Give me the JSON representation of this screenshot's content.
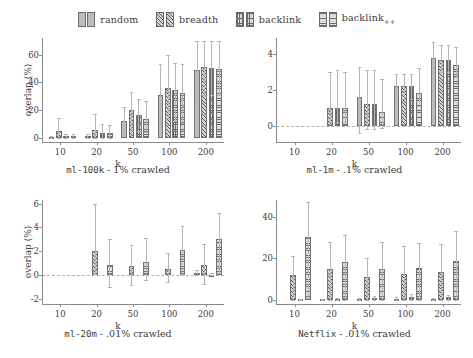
{
  "legend": {
    "entries": [
      {
        "label": "random",
        "pattern": "random",
        "color": "#bdbdbd"
      },
      {
        "label": "breadth",
        "pattern": "breadth",
        "color": "#5e5e5e"
      },
      {
        "label": "backlink",
        "pattern": "backlink",
        "color": "#dadada"
      },
      {
        "label": "backlink++",
        "pattern": "backlinkpp",
        "color": "#dcdcdc"
      }
    ]
  },
  "series_names": [
    "random",
    "breadth",
    "backlink",
    "backlink++"
  ],
  "chart_data": [
    {
      "id": "ml-100k",
      "type": "bar",
      "title": "ml-100k - 1% crawled",
      "title_mono": "ml-100k",
      "title_rest": " - 1% crawled",
      "xlabel": "k",
      "ylabel": "overlap (%)",
      "categories": [
        "10",
        "20",
        "50",
        "100",
        "200"
      ],
      "yticks": [
        0,
        20,
        40,
        60
      ],
      "ylim": [
        -3,
        72
      ],
      "grid": false,
      "zero_line": false,
      "series": [
        {
          "name": "random",
          "values": [
            0.5,
            1.0,
            12.5,
            31.0,
            49.0
          ],
          "err_low": [
            0.0,
            0.0,
            5.0,
            8.0,
            30.0
          ],
          "err_high": [
            1.5,
            2.5,
            22.0,
            53.0,
            70.0
          ]
        },
        {
          "name": "breadth",
          "values": [
            5.0,
            5.5,
            20.0,
            36.0,
            51.0
          ],
          "err_low": [
            0.0,
            0.0,
            6.0,
            14.0,
            31.0
          ],
          "err_high": [
            14.0,
            17.0,
            33.0,
            60.0,
            70.0
          ]
        },
        {
          "name": "backlink",
          "values": [
            1.0,
            3.5,
            16.5,
            34.5,
            50.5
          ],
          "err_low": [
            0.0,
            0.0,
            5.0,
            12.0,
            31.0
          ],
          "err_high": [
            2.5,
            10.0,
            28.0,
            54.0,
            70.0
          ]
        },
        {
          "name": "backlink++",
          "values": [
            1.0,
            3.5,
            13.5,
            32.5,
            50.0
          ],
          "err_low": [
            0.0,
            0.0,
            4.0,
            11.0,
            31.0
          ],
          "err_high": [
            2.5,
            9.0,
            26.5,
            53.0,
            70.0
          ]
        }
      ]
    },
    {
      "id": "ml-1m",
      "type": "bar",
      "title": "ml-1m - .1% crawled",
      "title_mono": "ml-1m",
      "title_rest": " - .1% crawled",
      "xlabel": "k",
      "ylabel": "",
      "categories": [
        "10",
        "20",
        "50",
        "100",
        "200"
      ],
      "yticks": [
        0,
        2,
        4
      ],
      "ylim": [
        -0.9,
        4.9
      ],
      "grid": false,
      "zero_line": true,
      "series": [
        {
          "name": "random",
          "values": [
            0.0,
            0.0,
            1.6,
            2.2,
            3.8
          ],
          "err_low": [
            0.0,
            0.0,
            -0.4,
            1.5,
            3.0
          ],
          "err_high": [
            0.0,
            0.0,
            3.3,
            2.9,
            4.7
          ]
        },
        {
          "name": "breadth",
          "values": [
            0.0,
            1.0,
            1.2,
            2.2,
            3.7
          ],
          "err_low": [
            0.0,
            0.2,
            -0.2,
            1.5,
            3.0
          ],
          "err_high": [
            0.0,
            3.0,
            3.1,
            2.9,
            4.5
          ]
        },
        {
          "name": "backlink",
          "values": [
            0.0,
            1.0,
            1.2,
            2.2,
            3.7
          ],
          "err_low": [
            0.0,
            0.2,
            -0.2,
            1.5,
            3.0
          ],
          "err_high": [
            0.0,
            3.1,
            3.1,
            2.9,
            4.5
          ]
        },
        {
          "name": "backlink++",
          "values": [
            0.0,
            1.0,
            0.75,
            1.85,
            3.4
          ],
          "err_low": [
            0.0,
            0.2,
            -0.1,
            1.1,
            2.7
          ],
          "err_high": [
            0.0,
            3.0,
            2.6,
            3.2,
            4.4
          ]
        }
      ]
    },
    {
      "id": "ml-20m",
      "type": "bar",
      "title": "ml-20m - .01% crawled",
      "title_mono": "ml-20m",
      "title_rest": " - .01% crawled",
      "xlabel": "k",
      "ylabel": "overlap (%)",
      "categories": [
        "10",
        "20",
        "50",
        "100",
        "200"
      ],
      "yticks": [
        -2,
        0,
        2,
        4,
        6
      ],
      "ylim": [
        -2.4,
        6.3
      ],
      "grid": false,
      "zero_line": true,
      "series": [
        {
          "name": "random",
          "values": [
            0.0,
            0.0,
            0.0,
            0.0,
            0.2
          ],
          "err_low": [
            0.0,
            0.0,
            0.0,
            0.0,
            0.0
          ],
          "err_high": [
            0.0,
            0.0,
            0.0,
            0.0,
            0.45
          ]
        },
        {
          "name": "breadth",
          "values": [
            0.0,
            2.0,
            0.8,
            0.55,
            0.9
          ],
          "err_low": [
            0.0,
            0.1,
            -0.85,
            -0.6,
            -0.7
          ],
          "err_high": [
            0.0,
            6.0,
            2.5,
            1.9,
            2.6
          ]
        },
        {
          "name": "backlink",
          "values": [
            0.0,
            0.0,
            0.0,
            0.0,
            0.05
          ],
          "err_low": [
            0.0,
            0.0,
            0.0,
            0.0,
            0.0
          ],
          "err_high": [
            0.0,
            0.0,
            0.0,
            0.0,
            0.2
          ]
        },
        {
          "name": "backlink++",
          "values": [
            0.0,
            0.9,
            1.15,
            2.15,
            3.0
          ],
          "err_low": [
            0.0,
            -1.0,
            -0.4,
            0.1,
            0.2
          ],
          "err_high": [
            0.0,
            3.0,
            3.1,
            4.1,
            5.2
          ]
        }
      ]
    },
    {
      "id": "netflix",
      "type": "bar",
      "title": "Netflix - .01% crawled",
      "title_mono": "Netflix",
      "title_rest": " - .01% crawled",
      "xlabel": "k",
      "ylabel": "",
      "categories": [
        "10",
        "20",
        "50",
        "100",
        "200"
      ],
      "yticks": [
        0,
        20,
        40
      ],
      "ylim": [
        -2,
        48
      ],
      "grid": false,
      "zero_line": false,
      "series": [
        {
          "name": "random",
          "values": [
            0.0,
            0.3,
            0.4,
            0.5,
            0.4
          ],
          "err_low": [
            0.0,
            0.0,
            0.0,
            0.0,
            0.0
          ],
          "err_high": [
            0.0,
            0.6,
            0.9,
            1.2,
            1.0
          ]
        },
        {
          "name": "breadth",
          "values": [
            12.0,
            14.8,
            11.0,
            12.3,
            13.3
          ],
          "err_low": [
            0.0,
            0.0,
            0.0,
            0.0,
            0.0
          ],
          "err_high": [
            21.0,
            28.0,
            20.0,
            26.0,
            27.0
          ]
        },
        {
          "name": "backlink",
          "values": [
            0.3,
            0.4,
            1.0,
            1.4,
            1.2
          ],
          "err_low": [
            0.0,
            0.0,
            0.0,
            0.0,
            0.0
          ],
          "err_high": [
            0.6,
            0.8,
            2.0,
            2.6,
            2.4
          ]
        },
        {
          "name": "backlink++",
          "values": [
            30.0,
            18.0,
            15.0,
            15.2,
            18.5
          ],
          "err_low": [
            1.0,
            0.0,
            0.0,
            0.0,
            0.0
          ],
          "err_high": [
            47.0,
            31.0,
            28.0,
            27.5,
            33.0
          ]
        }
      ]
    }
  ]
}
